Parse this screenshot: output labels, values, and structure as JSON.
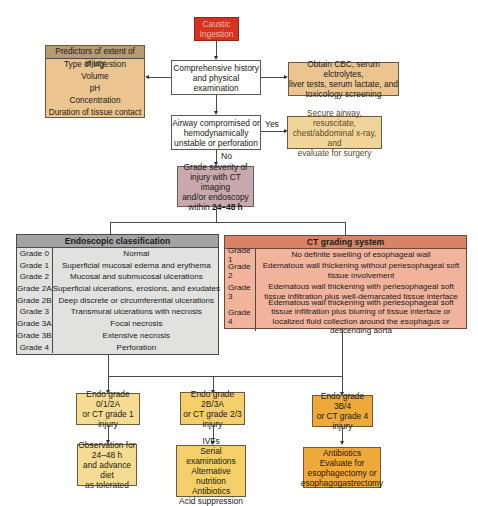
{
  "colors": {
    "start_red": "#d8311f",
    "tan": "#ebc48f",
    "light_tan": "#f1d49a",
    "mauve": "#c8a9ad",
    "gray_header": "#a3a3a3",
    "gray_body": "#e1e1df",
    "salmon_header": "#d98268",
    "salmon_body": "#f2b39c",
    "yellow_light": "#f6dc93",
    "yellow_mid": "#f4cf6a",
    "orange": "#efa93b"
  },
  "start": {
    "line1": "Caustic",
    "line2": "Ingestion"
  },
  "predictors": {
    "title": "Predictors of extent of injury",
    "items": [
      "Type of ingestion",
      "Volume",
      "pH",
      "Concentration",
      "Duration of tissue contact"
    ]
  },
  "history": {
    "line1": "Comprehensive history",
    "line2": "and physical examination"
  },
  "labs": {
    "line1": "Obtain CBC, serum elctrolytes,",
    "line2": "liver tests, serum lactate, and",
    "line3": "toxicology screening"
  },
  "airway": {
    "line1": "Airway compromised or",
    "line2": "hemodynamically",
    "line3": "unstable or perforation"
  },
  "yes_label": "Yes",
  "no_label": "No",
  "secure": {
    "line1": "Secure airway, resuscitate,",
    "line2": "chest/abdominal x-ray, and",
    "line3": "evaluate for surgery"
  },
  "grade_severity": {
    "line1": "Grade severity of",
    "line2": "injury with CT imaging",
    "line3": "and/or endoscopy",
    "line4_prefix": "within ",
    "line4_bold": "24–48 h"
  },
  "endoscopic": {
    "title": "Endoscopic classification",
    "rows": [
      {
        "grade": "Grade 0",
        "desc": "Normal"
      },
      {
        "grade": "Grade 1",
        "desc": "Superficial mucosal edema and erythema"
      },
      {
        "grade": "Grade 2",
        "desc": "Mucosal and submucosal ulcerations"
      },
      {
        "grade": "Grade 2A",
        "desc": "Superficial ulcerations, erosions, and exudates"
      },
      {
        "grade": "Grade 2B",
        "desc": "Deep discrete or circumferential ulcerations"
      },
      {
        "grade": "Grade 3",
        "desc": "Transmural ulcerations with necrosis"
      },
      {
        "grade": "Grade 3A",
        "desc": "Focal necrosis"
      },
      {
        "grade": "Grade 3B",
        "desc": "Extensive necrosis"
      },
      {
        "grade": "Grade 4",
        "desc": "Perforation"
      }
    ]
  },
  "ct": {
    "title": "CT grading system",
    "rows": [
      {
        "grade": "Grade 1",
        "desc": "No definite swelling of esophageal wall"
      },
      {
        "grade": "Grade 2",
        "desc": "Edematous wall thickening without periesophageal soft tissue involvement"
      },
      {
        "grade": "Grade 3",
        "desc": "Edematous wall thickening with periesophageal soft tissue infiltration plus well-demarcated tissue interface"
      },
      {
        "grade": "Grade 4",
        "desc": "Edematous wall thickening with periesophageal soft tissue infiltration plus blurring of tissue interface or localized fluid collection around the esophagus or descending aorta"
      }
    ]
  },
  "branches": [
    {
      "cond": [
        "Endo grade 0/1/2A",
        "or CT grade 1",
        "injury"
      ],
      "action": [
        "Observation for",
        "24–48 h",
        "and advance diet",
        "as tolerated"
      ]
    },
    {
      "cond": [
        "Endo grade 2B/3A",
        "or CT grade 2/3",
        "injury"
      ],
      "action": [
        "IVFs",
        "Serial examinations",
        "Alternative nutrition",
        "Antibiotics",
        "Acid suppression"
      ]
    },
    {
      "cond": [
        "Endo grade 3B/4",
        "or CT grade 4",
        "injury"
      ],
      "action": [
        "Antibiotics",
        "Evaluate for",
        "esophagectomy or",
        "esophagogastrectomy"
      ]
    }
  ]
}
